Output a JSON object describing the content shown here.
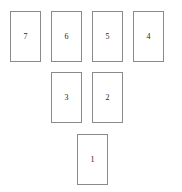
{
  "diagram": {
    "canvas": {
      "width": 182,
      "height": 192,
      "background": "#ffffff"
    },
    "style": {
      "card_border_color": "#8a8a8a",
      "card_fill_color": "#ffffff",
      "label_color": "#1c1c1c",
      "card_width": 31,
      "card_height": 51,
      "border_width": 1
    },
    "rows": [
      {
        "name": "top-row",
        "count": 4
      },
      {
        "name": "middle-row",
        "count": 2
      },
      {
        "name": "bottom-row",
        "count": 1
      }
    ],
    "cards": [
      {
        "id": "card-7",
        "label": "7",
        "row": "top-row",
        "column": 1,
        "x": 10,
        "y": 11,
        "width": 31,
        "height": 51
      },
      {
        "id": "card-6",
        "label": "6",
        "row": "top-row",
        "column": 2,
        "x": 51,
        "y": 11,
        "width": 31,
        "height": 51
      },
      {
        "id": "card-5",
        "label": "5",
        "row": "top-row",
        "column": 3,
        "x": 92,
        "y": 11,
        "width": 31,
        "height": 51
      },
      {
        "id": "card-4",
        "label": "4",
        "row": "top-row",
        "column": 4,
        "x": 133,
        "y": 11,
        "width": 31,
        "height": 51
      },
      {
        "id": "card-3",
        "label": "3",
        "row": "middle-row",
        "column": 2,
        "x": 51,
        "y": 72,
        "width": 31,
        "height": 51
      },
      {
        "id": "card-2",
        "label": "2",
        "row": "middle-row",
        "column": 3,
        "x": 92,
        "y": 72,
        "width": 31,
        "height": 51
      },
      {
        "id": "card-1",
        "label": "1",
        "row": "bottom-row",
        "column": 1,
        "x": 77,
        "y": 134,
        "width": 31,
        "height": 51
      }
    ]
  }
}
